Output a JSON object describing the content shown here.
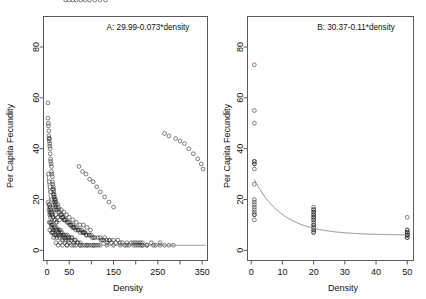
{
  "figure": {
    "background": "#ffffff",
    "point_color": "#2b2b2b",
    "curve_color": "#8c8c8c",
    "axis_color": "#5a5a5a"
  },
  "chart_data": [
    {
      "type": "scatter",
      "panel": "A",
      "title": "A: 29.99-0.073*density",
      "xlabel": "Density",
      "ylabel": "Per Capita Fecundity",
      "xlim": [
        -8,
        362
      ],
      "ylim": [
        -4,
        92
      ],
      "xticks": [
        0,
        50,
        100,
        150,
        200,
        250,
        300,
        350
      ],
      "xticklabels": [
        "0",
        "50",
        "",
        "150",
        "",
        "250",
        "",
        "350"
      ],
      "yticks": [
        0,
        20,
        40,
        60,
        80
      ],
      "yticklabels": [
        "0",
        "20",
        "40",
        "60",
        "80"
      ],
      "grid": false,
      "legend": "none",
      "marker": "open-circle",
      "fit": {
        "equation": "29.99-0.073*density",
        "intercept": 29.99,
        "slope": -0.073,
        "form": "exponential-decay",
        "asymptote": 2.0
      },
      "x": [
        2,
        2,
        3,
        3,
        4,
        4,
        5,
        5,
        5,
        6,
        6,
        7,
        7,
        8,
        8,
        9,
        10,
        10,
        11,
        12,
        12,
        13,
        14,
        15,
        15,
        16,
        17,
        18,
        19,
        20,
        3,
        4,
        5,
        6,
        7,
        8,
        9,
        10,
        11,
        12,
        13,
        14,
        15,
        16,
        17,
        18,
        19,
        20,
        21,
        22,
        6,
        8,
        9,
        11,
        13,
        14,
        16,
        18,
        20,
        22,
        24,
        25,
        27,
        28,
        30,
        32,
        34,
        36,
        38,
        40,
        5,
        7,
        9,
        12,
        15,
        18,
        21,
        24,
        27,
        30,
        33,
        36,
        39,
        42,
        45,
        48,
        51,
        54,
        57,
        60,
        10,
        14,
        18,
        22,
        26,
        30,
        34,
        38,
        42,
        46,
        50,
        54,
        58,
        62,
        66,
        70,
        74,
        78,
        82,
        86,
        12,
        16,
        20,
        25,
        30,
        35,
        40,
        45,
        50,
        55,
        60,
        65,
        70,
        75,
        80,
        85,
        90,
        95,
        100,
        105,
        15,
        22,
        28,
        35,
        42,
        48,
        55,
        62,
        68,
        75,
        82,
        88,
        95,
        102,
        108,
        115,
        122,
        128,
        135,
        142,
        20,
        30,
        40,
        50,
        60,
        70,
        80,
        90,
        100,
        110,
        120,
        130,
        140,
        150,
        160,
        170,
        180,
        190,
        200,
        210,
        25,
        35,
        45,
        55,
        65,
        75,
        85,
        95,
        105,
        115,
        125,
        135,
        145,
        155,
        165,
        175,
        185,
        195,
        205,
        215,
        45,
        60,
        75,
        90,
        105,
        120,
        135,
        150,
        165,
        180,
        195,
        205,
        215,
        225,
        235,
        245,
        255,
        265,
        275,
        285,
        200,
        210,
        215,
        225,
        240,
        255,
        265,
        275,
        290,
        300,
        310,
        320,
        330,
        340,
        348,
        352,
        3,
        5,
        7,
        9,
        11,
        14,
        17,
        20,
        24,
        28,
        32,
        38,
        44,
        50,
        58,
        66,
        74,
        82,
        90,
        98,
        6,
        10,
        14,
        20,
        26,
        32,
        40,
        48,
        56,
        64,
        72,
        80,
        88,
        96,
        104,
        112,
        120,
        130,
        140,
        150,
        4,
        6,
        8,
        10,
        13,
        16,
        20,
        25,
        30,
        36,
        42,
        50,
        58,
        66,
        76,
        86,
        96,
        108,
        120,
        132
      ],
      "y": [
        58,
        52,
        50,
        49,
        47,
        45,
        44,
        43,
        44,
        42,
        41,
        40,
        38,
        36,
        35,
        34,
        33,
        31,
        30,
        29,
        27,
        26,
        25,
        24,
        23,
        22,
        21,
        20,
        20,
        19,
        19,
        18,
        18,
        17,
        17,
        16,
        16,
        15,
        15,
        14,
        24,
        22,
        21,
        20,
        19,
        18,
        18,
        17,
        16,
        16,
        15,
        15,
        14,
        14,
        13,
        13,
        12,
        12,
        11,
        11,
        18,
        17,
        16,
        15,
        14,
        14,
        13,
        13,
        12,
        12,
        11,
        11,
        10,
        10,
        9,
        9,
        9,
        8,
        8,
        8,
        14,
        13,
        12,
        12,
        11,
        11,
        10,
        10,
        9,
        9,
        9,
        8,
        8,
        8,
        7,
        7,
        7,
        6,
        6,
        6,
        11,
        10,
        10,
        9,
        9,
        8,
        8,
        8,
        7,
        7,
        7,
        6,
        6,
        6,
        6,
        5,
        5,
        5,
        5,
        5,
        9,
        8,
        8,
        7,
        7,
        7,
        6,
        6,
        6,
        5,
        5,
        5,
        5,
        4,
        4,
        4,
        4,
        4,
        3,
        3,
        7,
        6,
        6,
        5,
        5,
        5,
        4,
        4,
        4,
        4,
        3,
        3,
        3,
        3,
        3,
        3,
        2,
        2,
        2,
        2,
        5,
        5,
        4,
        4,
        4,
        3,
        3,
        3,
        3,
        3,
        2,
        2,
        2,
        2,
        2,
        2,
        2,
        2,
        2,
        2,
        4,
        3,
        3,
        3,
        3,
        2,
        2,
        2,
        2,
        2,
        2,
        2,
        2,
        2,
        2,
        2,
        2,
        2,
        2,
        2,
        3,
        3,
        3,
        2,
        3,
        2,
        3,
        2,
        2,
        2,
        2,
        2,
        2,
        2,
        2,
        2,
        46,
        45,
        44,
        43,
        42,
        40,
        38,
        36,
        34,
        32,
        30,
        27,
        25,
        23,
        20,
        18,
        16,
        14,
        13,
        12,
        16,
        15,
        14,
        13,
        12,
        11,
        10,
        10,
        9,
        8,
        8,
        7,
        7,
        6,
        6,
        6,
        5,
        5,
        5,
        4,
        33,
        31,
        30,
        28,
        27,
        25,
        23,
        21,
        19,
        17,
        16,
        14,
        13,
        11,
        10,
        9,
        8,
        7,
        6,
        6
      ]
    },
    {
      "type": "scatter",
      "panel": "B",
      "title": "B: 30.37-0.11*density",
      "xlabel": "Density",
      "ylabel": "Per Capita Fecundity",
      "xlim": [
        -1.2,
        52
      ],
      "ylim": [
        -4,
        92
      ],
      "xticks": [
        0,
        10,
        20,
        30,
        40,
        50
      ],
      "xticklabels": [
        "0",
        "10",
        "20",
        "30",
        "40",
        "50"
      ],
      "yticks": [
        0,
        20,
        40,
        60,
        80
      ],
      "yticklabels": [
        "0",
        "20",
        "40",
        "60",
        "80"
      ],
      "grid": false,
      "legend": "none",
      "marker": "open-circle",
      "fit": {
        "equation": "30.37-0.11*density",
        "intercept": 30.37,
        "slope": -0.11,
        "form": "exponential-decay",
        "asymptote": 6.0
      },
      "x": [
        1,
        1,
        1,
        1,
        1,
        1,
        1,
        1,
        1,
        1,
        1,
        1,
        1,
        1,
        1,
        1,
        1,
        1,
        20,
        20,
        20,
        20,
        20,
        20,
        20,
        20,
        20,
        20,
        20,
        20,
        20,
        20,
        20,
        20,
        20,
        20,
        20,
        20,
        50,
        50,
        50,
        50,
        50,
        50,
        50,
        50,
        50,
        50,
        50,
        50
      ],
      "y": [
        73,
        55,
        50,
        35,
        35,
        34,
        34,
        32,
        26,
        20,
        19,
        18,
        17,
        16,
        15,
        14,
        14,
        12,
        17,
        16,
        16,
        15,
        15,
        14,
        14,
        13,
        13,
        12,
        12,
        11,
        10,
        10,
        9,
        9,
        8,
        8,
        7,
        7,
        13,
        8,
        8,
        7,
        7,
        7,
        6,
        6,
        6,
        6,
        5,
        5
      ]
    }
  ]
}
